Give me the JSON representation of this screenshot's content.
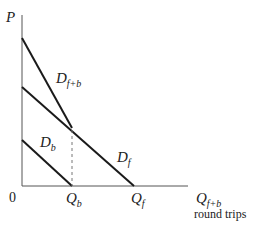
{
  "diagram": {
    "title": "",
    "axes": {
      "y_label": "P",
      "x_label_main": "Q",
      "x_label_sub": "f+b",
      "x_label_caption": "round trips",
      "origin_label": "0"
    },
    "curves": [
      {
        "id": "D_f+b",
        "label_main": "D",
        "label_sub": "f+b"
      },
      {
        "id": "D_f",
        "label_main": "D",
        "label_sub": "f"
      },
      {
        "id": "D_b",
        "label_main": "D",
        "label_sub": "b"
      }
    ],
    "x_ticks": [
      {
        "label_main": "Q",
        "label_sub": "b"
      },
      {
        "label_main": "Q",
        "label_sub": "f"
      }
    ],
    "colors": {
      "line": "#1a1a1a",
      "axis": "#555555",
      "dashed": "#777777",
      "text": "#222222"
    }
  }
}
